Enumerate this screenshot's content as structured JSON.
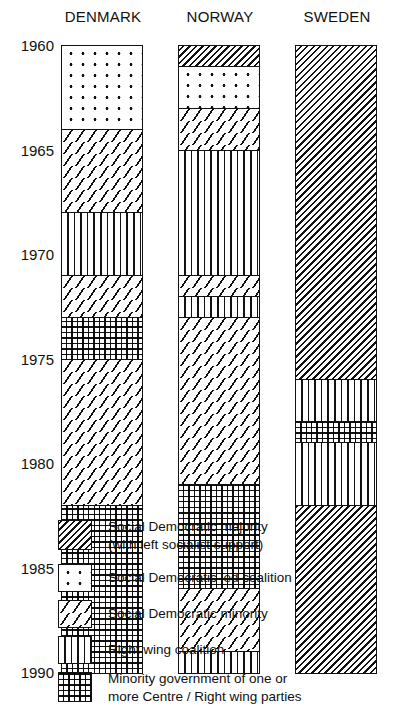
{
  "chart_data": {
    "type": "stacked-timeline",
    "title": "",
    "columns": [
      "DENMARK",
      "NORWAY",
      "SWEDEN"
    ],
    "y_ticks": [
      1960,
      1965,
      1970,
      1975,
      1980,
      1985,
      1990
    ],
    "ylim": [
      1960,
      1990
    ],
    "grid": false,
    "legend_position": "bottom",
    "categories": {
      "maj": "Social Democratic majority (with left socialist support)",
      "dot": "Social Democratic led coalition",
      "min": "Social Democratic minority",
      "rwc": "Right wing coalition",
      "grid": "Minority government of one or more Centre / Right wing parties"
    },
    "series": [
      {
        "name": "DENMARK",
        "segments": [
          {
            "from": 1960,
            "to": 1964,
            "type": "dot"
          },
          {
            "from": 1964,
            "to": 1968,
            "type": "min"
          },
          {
            "from": 1968,
            "to": 1971,
            "type": "rwc"
          },
          {
            "from": 1971,
            "to": 1973,
            "type": "min"
          },
          {
            "from": 1973,
            "to": 1975,
            "type": "grid"
          },
          {
            "from": 1975,
            "to": 1982,
            "type": "min"
          },
          {
            "from": 1982,
            "to": 1990,
            "type": "grid"
          }
        ]
      },
      {
        "name": "NORWAY",
        "segments": [
          {
            "from": 1960,
            "to": 1961,
            "type": "maj"
          },
          {
            "from": 1961,
            "to": 1963,
            "type": "dot"
          },
          {
            "from": 1963,
            "to": 1965,
            "type": "min"
          },
          {
            "from": 1965,
            "to": 1971,
            "type": "rwc"
          },
          {
            "from": 1971,
            "to": 1972,
            "type": "min"
          },
          {
            "from": 1972,
            "to": 1973,
            "type": "rwc"
          },
          {
            "from": 1973,
            "to": 1981,
            "type": "min"
          },
          {
            "from": 1981,
            "to": 1986,
            "type": "grid"
          },
          {
            "from": 1986,
            "to": 1989,
            "type": "min"
          },
          {
            "from": 1989,
            "to": 1990,
            "type": "rwc"
          }
        ]
      },
      {
        "name": "SWEDEN",
        "segments": [
          {
            "from": 1960,
            "to": 1976,
            "type": "maj"
          },
          {
            "from": 1976,
            "to": 1978,
            "type": "rwc"
          },
          {
            "from": 1978,
            "to": 1979,
            "type": "grid"
          },
          {
            "from": 1979,
            "to": 1982,
            "type": "rwc"
          },
          {
            "from": 1982,
            "to": 1990,
            "type": "maj"
          }
        ]
      }
    ]
  },
  "labels": {
    "columns": [
      "DENMARK",
      "NORWAY",
      "SWEDEN"
    ],
    "ticks": [
      "1960",
      "1965",
      "1970",
      "1975",
      "1980",
      "1985",
      "1990"
    ]
  },
  "legend": [
    {
      "type": "maj",
      "lines": [
        "Social Democratic majority",
        "(with left socialist support)"
      ]
    },
    {
      "type": "dot",
      "lines": [
        "Social Democratic led coalition"
      ]
    },
    {
      "type": "min",
      "lines": [
        "Social Democratic minority"
      ]
    },
    {
      "type": "rwc",
      "lines": [
        "Right wing coalition"
      ]
    },
    {
      "type": "grid",
      "lines": [
        "Minority government of one or",
        "more Centre / Right wing parties"
      ]
    }
  ]
}
